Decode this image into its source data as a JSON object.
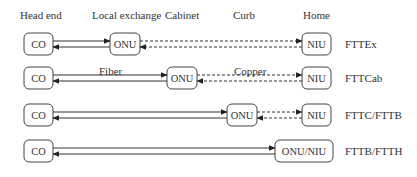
{
  "headers": [
    {
      "label": "Head end",
      "x": 20,
      "y": 19
    },
    {
      "label": "Local exchange",
      "x": 92,
      "y": 19
    },
    {
      "label": "Cabinet",
      "x": 165,
      "y": 19
    },
    {
      "label": "Curb",
      "x": 233,
      "y": 19
    },
    {
      "label": "Home",
      "x": 303,
      "y": 19
    }
  ],
  "media_labels": {
    "fiber": {
      "label": "Fiber",
      "x": 99,
      "y": 75
    },
    "copper": {
      "label": "Copper",
      "x": 234,
      "y": 75
    }
  },
  "rows": [
    {
      "name": "FTTEx",
      "y": 33,
      "co": {
        "label": "CO",
        "x": 24,
        "w": 29
      },
      "onu": {
        "label": "ONU",
        "x": 110,
        "w": 30
      },
      "niu": {
        "label": "NIU",
        "x": 302,
        "w": 29
      },
      "type_label": "FTTEx"
    },
    {
      "name": "FTTCab",
      "y": 67,
      "co": {
        "label": "CO",
        "x": 24,
        "w": 29
      },
      "onu": {
        "label": "ONU",
        "x": 167,
        "w": 30
      },
      "niu": {
        "label": "NIU",
        "x": 302,
        "w": 29
      },
      "type_label": "FTTCab"
    },
    {
      "name": "FTTC/FTTB",
      "y": 104,
      "co": {
        "label": "CO",
        "x": 24,
        "w": 29
      },
      "onu": {
        "label": "ONU",
        "x": 227,
        "w": 30
      },
      "niu": {
        "label": "NIU",
        "x": 302,
        "w": 29
      },
      "type_label": "FTTC/FTTB"
    },
    {
      "name": "FTTB/FTTH",
      "y": 140,
      "co": {
        "label": "CO",
        "x": 24,
        "w": 29
      },
      "onu": {
        "label": "ONU/NIU",
        "x": 275,
        "w": 58
      },
      "niu": null,
      "type_label": "FTTB/FTTH"
    }
  ],
  "colors": {
    "line": "#333333",
    "box": "#444444",
    "text": "#333333"
  }
}
